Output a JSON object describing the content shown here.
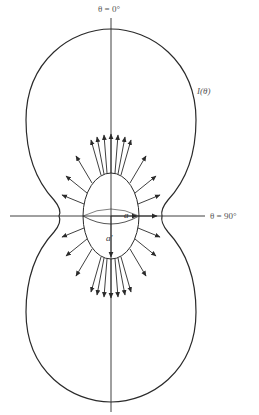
{
  "figure": {
    "labels": {
      "top_axis": "θ = 0°",
      "right_axis": "θ = 90°",
      "curve": "I(θ)",
      "semi_axis_horizontal": "a",
      "semi_axis_vertical": "a′"
    },
    "colors": {
      "stroke": "#2a2a2a",
      "label": "#555555",
      "background": "#ffffff"
    }
  }
}
